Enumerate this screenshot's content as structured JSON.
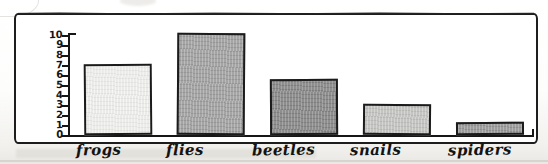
{
  "chart_data": {
    "type": "bar",
    "title": "",
    "xlabel": "",
    "ylabel": "",
    "categories": [
      "frogs",
      "flies",
      "beetles",
      "snails",
      "spiders"
    ],
    "values": [
      7,
      10,
      5.5,
      3,
      1.3
    ],
    "ylim": [
      0,
      10
    ],
    "yticks": [
      "0",
      "1",
      "2",
      "3",
      "4",
      "5",
      "6",
      "7",
      "8",
      "9",
      "10"
    ],
    "grid": false,
    "legend": null,
    "series": [
      {
        "name": "count",
        "values": [
          7,
          10,
          5.5,
          3,
          1.3
        ]
      }
    ],
    "bar_colors": [
      "#f3f3f1",
      "#a2a2a2",
      "#878787",
      "#c6c6c4",
      "#9a9a9a"
    ],
    "style": "hand-drawn"
  },
  "axis": {
    "y_tick_labels": [
      "10",
      "9",
      "8",
      "7",
      "6",
      "5",
      "4",
      "3",
      "2",
      "1",
      "0"
    ]
  },
  "bars": [
    {
      "label": "frogs",
      "value": 7,
      "color": "#f3f3f1"
    },
    {
      "label": "flies",
      "value": 10,
      "color": "#a2a2a2"
    },
    {
      "label": "beetles",
      "value": 5.5,
      "color": "#878787"
    },
    {
      "label": "snails",
      "value": 3,
      "color": "#c6c6c4"
    },
    {
      "label": "spiders",
      "value": 1.3,
      "color": "#9a9a9a"
    }
  ]
}
